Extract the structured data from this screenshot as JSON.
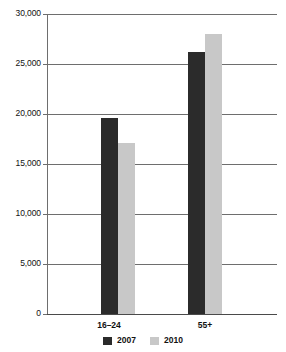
{
  "chart_data": {
    "type": "bar",
    "title": "",
    "subtitle": "",
    "xlabel": "",
    "ylabel": "",
    "categories": [
      "16–24",
      "55+"
    ],
    "series": [
      {
        "name": "2007",
        "color": "#2b2b2b",
        "values": [
          19600,
          26200
        ]
      },
      {
        "name": "2010",
        "color": "#c8c8c8",
        "values": [
          17100,
          28000
        ]
      }
    ],
    "ylim": [
      0,
      30000
    ],
    "ytick_values": [
      0,
      5000,
      10000,
      15000,
      20000,
      25000,
      30000
    ],
    "ytick_labels": [
      "0",
      "5,000",
      "10,000",
      "15,000",
      "20,000",
      "25,000",
      "30,000"
    ],
    "grid": true,
    "grid_axis": "y",
    "legend_position": "bottom",
    "legend_entries": [
      {
        "label": "2007",
        "color": "#2b2b2b"
      },
      {
        "label": "2010",
        "color": "#c8c8c8"
      }
    ]
  },
  "axis": {
    "y_labels": [
      "30,000",
      "25,000",
      "20,000",
      "15,000",
      "10,000",
      "5,000",
      "0"
    ],
    "x_labels": [
      "16–24",
      "55+"
    ]
  },
  "legend": {
    "items": [
      {
        "label": "2007"
      },
      {
        "label": "2010"
      }
    ]
  },
  "colors": {
    "series_2007": "#2b2b2b",
    "series_2010": "#c8c8c8",
    "gridline": "#6e6e6e",
    "axis": "#4a4a4a",
    "background": "#ffffff",
    "text": "#111111"
  }
}
